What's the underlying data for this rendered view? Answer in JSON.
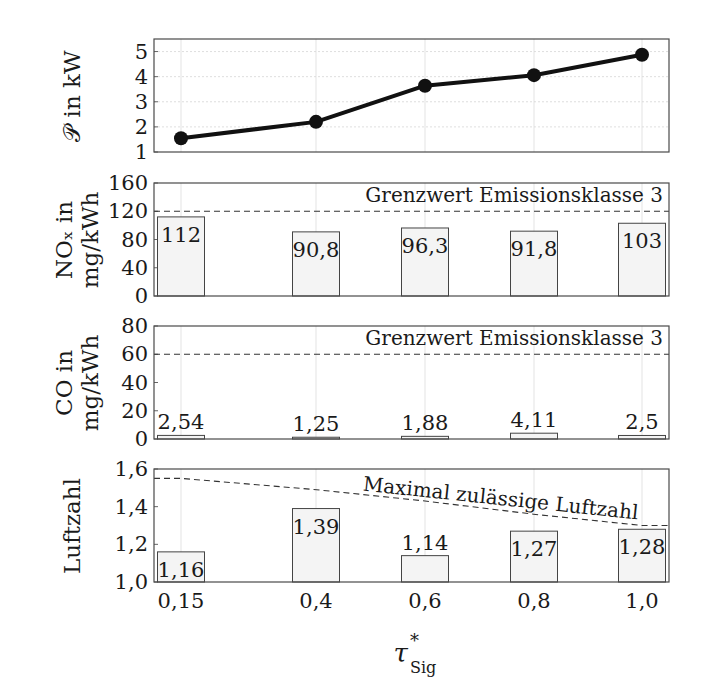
{
  "chart_data": [
    {
      "type": "line",
      "panel": "power",
      "ylabel": "𝒫 in kW",
      "x": [
        "0,15",
        "0,4",
        "0,6",
        "0,8",
        "1,0"
      ],
      "x_numeric": [
        0.15,
        0.4,
        0.6,
        0.8,
        1.0
      ],
      "values": [
        1.55,
        2.2,
        3.64,
        4.06,
        4.87
      ],
      "ylim": [
        1,
        5.5
      ],
      "yticks": [
        1,
        2,
        3,
        4,
        5
      ],
      "grid": true,
      "markers": true
    },
    {
      "type": "bar",
      "panel": "nox",
      "ylabel_line1": "NOₓ in",
      "ylabel_line2": "mg/kWh",
      "categories": [
        "0,15",
        "0,4",
        "0,6",
        "0,8",
        "1,0"
      ],
      "values": [
        112,
        90.8,
        96.3,
        91.8,
        103
      ],
      "value_labels": [
        "112",
        "90,8",
        "96,3",
        "91,8",
        "103"
      ],
      "ylim": [
        0,
        160
      ],
      "yticks": [
        0,
        40,
        80,
        120,
        160
      ],
      "limit_line": {
        "value": 120,
        "label": "Grenzwert Emissionsklasse 3"
      }
    },
    {
      "type": "bar",
      "panel": "co",
      "ylabel_line1": "CO in",
      "ylabel_line2": "mg/kWh",
      "categories": [
        "0,15",
        "0,4",
        "0,6",
        "0,8",
        "1,0"
      ],
      "values": [
        2.54,
        1.25,
        1.88,
        4.11,
        2.5
      ],
      "value_labels": [
        "2,54",
        "1,25",
        "1,88",
        "4,11",
        "2,5"
      ],
      "ylim": [
        0,
        80
      ],
      "yticks": [
        0,
        20,
        40,
        60,
        80
      ],
      "limit_line": {
        "value": 60,
        "label": "Grenzwert Emissionsklasse 3"
      }
    },
    {
      "type": "bar",
      "panel": "luftzahl",
      "ylabel": "Luftzahl",
      "categories": [
        "0,15",
        "0,4",
        "0,6",
        "0,8",
        "1,0"
      ],
      "values": [
        1.16,
        1.39,
        1.14,
        1.27,
        1.28
      ],
      "value_labels": [
        "1,16",
        "1,39",
        "1,14",
        "1,27",
        "1,28"
      ],
      "ylim": [
        1.0,
        1.6
      ],
      "yticks": [
        1.0,
        1.2,
        1.4,
        1.6
      ],
      "ytick_labels": [
        "1,0",
        "1,2",
        "1,4",
        "1,6"
      ],
      "limit_curve": {
        "label": "Maximal zulässige Luftzahl",
        "points": [
          [
            0.05,
            1.55
          ],
          [
            0.15,
            1.55
          ],
          [
            0.4,
            1.49
          ],
          [
            0.6,
            1.43
          ],
          [
            0.8,
            1.36
          ],
          [
            1.0,
            1.3
          ],
          [
            1.05,
            1.3
          ]
        ]
      }
    }
  ],
  "xaxis": {
    "tick_labels": [
      "0,15",
      "0,4",
      "0,6",
      "0,8",
      "1,0"
    ],
    "label_main": "τ",
    "label_sup": "*",
    "label_sub": "Sig"
  }
}
